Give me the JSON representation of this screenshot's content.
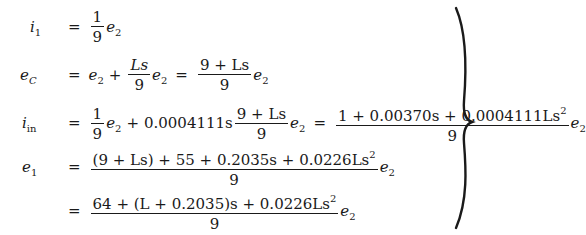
{
  "equations": {
    "eq1": {
      "lhs": "i",
      "lhs_sub": "1",
      "coef_num": "1",
      "coef_den": "9",
      "var": "e",
      "var_sub": "2"
    },
    "eq2": {
      "lhs": "e",
      "lhs_sub": "C",
      "t1": "e",
      "t1_sub": "2",
      "plus": "+",
      "frac_num": "Ls",
      "frac_den": "9",
      "t2": "e",
      "t2_sub": "2",
      "rhs_num": "9 + Ls",
      "rhs_den": "9",
      "rhs_var": "e",
      "rhs_var_sub": "2"
    },
    "eq3": {
      "lhs": "i",
      "lhs_sub": "in",
      "coef_num": "1",
      "coef_den": "9",
      "t1": "e",
      "t1_sub": "2",
      "plus": "+",
      "k": "0.0004111s",
      "frac_num": "9 + Ls",
      "frac_den": "9",
      "t2": "e",
      "t2_sub": "2",
      "rhs_num": "1 + 0.00370s + 0.0004111Ls",
      "rhs_num_sup": "2",
      "rhs_den": "9",
      "rhs_var": "e",
      "rhs_var_sub": "2"
    },
    "eq4": {
      "lhs": "e",
      "lhs_sub": "1",
      "num": "(9 + Ls) + 55 + 0.2035s + 0.0226Ls",
      "num_sup": "2",
      "den": "9",
      "var": "e",
      "var_sub": "2"
    },
    "eq5": {
      "num": "64 + (L + 0.2035)s + 0.0226Ls",
      "num_sup": "2",
      "den": "9",
      "var": "e",
      "var_sub": "2"
    },
    "equals": "="
  }
}
